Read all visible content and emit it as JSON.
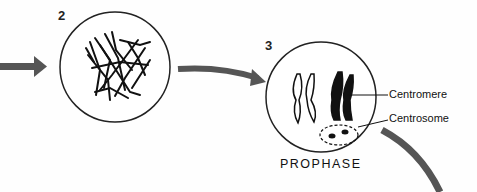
{
  "diagram": {
    "stages": [
      {
        "number": "2",
        "name": ""
      },
      {
        "number": "3",
        "name": "PROPHASE"
      }
    ],
    "labels": {
      "centromere": "Centromere",
      "centrosome": "Centrosome"
    },
    "colors": {
      "arrow": "#555555",
      "ink": "#111111"
    }
  }
}
